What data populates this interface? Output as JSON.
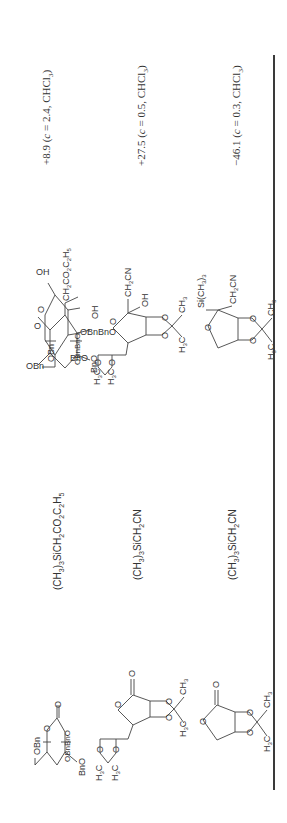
{
  "table": {
    "orientation": "rotated-90-ccw",
    "columns": [
      "lactone",
      "reagent",
      "product",
      "optical_rotation"
    ],
    "rows": [
      {
        "lactone": {
          "name": "2,3,4,6-tetra-O-benzyl-D-glucono-1,5-lactone",
          "labels": [
            "OBn",
            "O",
            "O",
            "OBnBnO",
            "BnO"
          ]
        },
        "reagent": {
          "prefix": "(CH",
          "sub1": "3",
          "mid": ")",
          "sub2": "3",
          "rest": "SiCH",
          "sub3": "2",
          "rest2": "CO",
          "sub4": "2",
          "rest3": "C",
          "sub5": "2",
          "rest4": "H",
          "sub6": "5",
          "full": "(CH3)3SiCH2CO2C2H5"
        },
        "product": {
          "labels": [
            "OBn",
            "CH2CO2C2H5",
            "OH",
            "OBnBnO",
            "BnO"
          ]
        },
        "rotation": "+8.9 (c = 2.4, CHCl3)",
        "rotation_parts": {
          "value": "+8.9 (",
          "c": "c",
          "rest": " = 2.4, CHCl",
          "sub": "3",
          "close": ")"
        }
      },
      {
        "lactone": {
          "name": "2,3:5,6-di-O-isopropylidene-D-mannono-1,4-lactone",
          "labels": [
            "O",
            "O",
            "O",
            "O",
            "O",
            "O",
            "CH3",
            "H3C",
            "H3C",
            "H3C"
          ]
        },
        "reagent": {
          "full": "(CH3)3SiCH2CN"
        },
        "product": {
          "labels": [
            "CH2CN",
            "OH",
            "CH3",
            "H3C",
            "H3C",
            "H3C"
          ]
        },
        "rotation": "+27.5 (c = 0.5, CHCl3)",
        "rotation_parts": {
          "value": "+27.5 (",
          "c": "c",
          "rest": " = 0.5, CHCl",
          "sub": "3",
          "close": ")"
        }
      },
      {
        "lactone": {
          "name": "2,3-O-isopropylidene-D-erythrono-1,4-lactone",
          "labels": [
            "O",
            "O",
            "O",
            "O",
            "CH3",
            "H3C"
          ]
        },
        "reagent": {
          "full": "(CH3)3SiCH2CN"
        },
        "product": {
          "labels": [
            "Si(CH3)3",
            "CH2CN",
            "CH3",
            "H3C"
          ]
        },
        "rotation": "−46.1 (c = 0.3, CHCl3)",
        "rotation_parts": {
          "value": "−46.1 (",
          "c": "c",
          "rest": " = 0.3, CHCl",
          "sub": "3",
          "close": ")"
        }
      }
    ]
  },
  "labels": {
    "OBn": "OBn",
    "BnO": "BnO",
    "OBnBnO": "OBnBnO",
    "O": "O",
    "OH": "OH",
    "CH": "CH",
    "H": "H",
    "C": "C",
    "CN": "CN",
    "CO": "CO",
    "Si": "Si(CH",
    "sub2": "2",
    "sub3": "3",
    "sub5": "5",
    "close": ")",
    "close3": ")3"
  }
}
